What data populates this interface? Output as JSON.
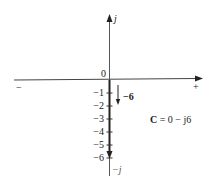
{
  "diagram": {
    "type": "complex-plane-phasor",
    "axes": {
      "imag_positive_label": "j",
      "imag_negative_label": "−j",
      "real_negative_label": "−",
      "real_positive_label": "+",
      "origin_label": "0"
    },
    "imag_ticks": [
      {
        "label": "−1",
        "value": -1
      },
      {
        "label": "−2",
        "value": -2
      },
      {
        "label": "−3",
        "value": -3
      },
      {
        "label": "−4",
        "value": -4
      },
      {
        "label": "−5",
        "value": -5
      },
      {
        "label": "−6",
        "value": -6
      }
    ],
    "phasor": {
      "magnitude_label": "−6",
      "equation_lhs": "C",
      "equation_rhs": " = 0 − j6",
      "real": 0,
      "imag": -6
    },
    "colors": {
      "axis": "#333333",
      "phasor": "#222222",
      "text": "#222222"
    }
  }
}
